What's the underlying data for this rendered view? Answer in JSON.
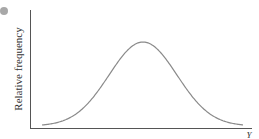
{
  "chart_data": {
    "type": "line",
    "title": "",
    "xlabel": "Y",
    "ylabel": "Relative frequency",
    "x_ticks": [],
    "y_ticks": [],
    "grid": false,
    "legend": null,
    "series": [
      {
        "name": "distribution",
        "shape": "normal",
        "peak_position_fraction_of_x": 0.5,
        "color": "#8a8a8a"
      }
    ]
  },
  "decorations": {
    "bullet_color": "#a8a8a8",
    "axis_color": "#555555",
    "curve_color": "#8a8a8a"
  }
}
